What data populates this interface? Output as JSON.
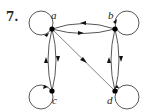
{
  "problem": {
    "number": "7."
  },
  "graph": {
    "type": "directed",
    "nodes": [
      {
        "id": "a",
        "label": "a",
        "x": 52,
        "y": 29
      },
      {
        "id": "b",
        "label": "b",
        "x": 115,
        "y": 29
      },
      {
        "id": "c",
        "label": "c",
        "x": 52,
        "y": 91
      },
      {
        "id": "d",
        "label": "d",
        "x": 115,
        "y": 91
      }
    ],
    "edges": [
      {
        "from": "a",
        "to": "a",
        "kind": "loop"
      },
      {
        "from": "b",
        "to": "b",
        "kind": "loop"
      },
      {
        "from": "c",
        "to": "c",
        "kind": "loop"
      },
      {
        "from": "d",
        "to": "d",
        "kind": "loop"
      },
      {
        "from": "b",
        "to": "a",
        "kind": "arc-upper"
      },
      {
        "from": "a",
        "to": "b",
        "kind": "arc-lower"
      },
      {
        "from": "c",
        "to": "a",
        "kind": "arc-left"
      },
      {
        "from": "a",
        "to": "c",
        "kind": "arc-right"
      },
      {
        "from": "d",
        "to": "b",
        "kind": "arc-left"
      },
      {
        "from": "b",
        "to": "d",
        "kind": "arc-right"
      },
      {
        "from": "a",
        "to": "d",
        "kind": "straight"
      }
    ],
    "colors": {
      "node": "#000000",
      "edge": "#444444",
      "diagonal": "#777777"
    }
  }
}
